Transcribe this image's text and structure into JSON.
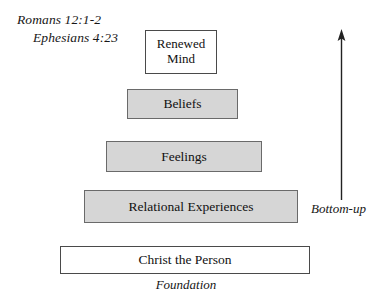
{
  "diagram": {
    "scripture_references": [
      {
        "id": "romans",
        "text": "Romans 12:1-2"
      },
      {
        "id": "ephesians",
        "text": "Ephesians 4:23"
      }
    ],
    "tiers": [
      {
        "id": "renewed-mind",
        "label": "Renewed\nMind",
        "level": 5,
        "fill": "white"
      },
      {
        "id": "beliefs",
        "label": "Beliefs",
        "level": 4,
        "fill": "gray"
      },
      {
        "id": "feelings",
        "label": "Feelings",
        "level": 3,
        "fill": "gray"
      },
      {
        "id": "relational-experiences",
        "label": "Relational Experiences",
        "level": 2,
        "fill": "gray"
      },
      {
        "id": "christ-the-person",
        "label": "Christ the Person",
        "level": 1,
        "fill": "white"
      }
    ],
    "captions": {
      "foundation": "Foundation",
      "direction": "Bottom-up"
    },
    "arrow": {
      "name": "upward-arrow",
      "direction": "up"
    },
    "colors": {
      "box_fill_gray": "#d6d6d6",
      "box_fill_white": "#ffffff",
      "box_border": "#5c5c5c",
      "text": "#111111",
      "background": "#ffffff"
    }
  }
}
